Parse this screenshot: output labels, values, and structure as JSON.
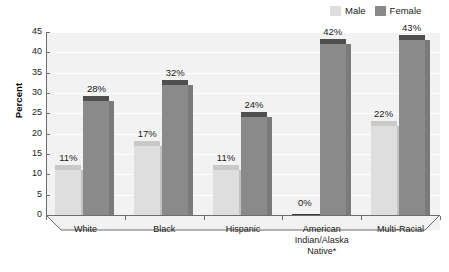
{
  "chart_data": {
    "type": "bar",
    "title": "",
    "xlabel": "",
    "ylabel": "Percent",
    "ylim": [
      0,
      45
    ],
    "ytick_step": 5,
    "yticks": [
      "45",
      "40",
      "35",
      "30",
      "25",
      "20",
      "15",
      "10",
      "5",
      "0"
    ],
    "grid": true,
    "legend_position": "top-right",
    "value_label_suffix": "%",
    "categories": [
      "White",
      "Black",
      "Hispanic",
      "American Indian/Alaska Native*",
      "Multi-Racial"
    ],
    "category_lines": [
      [
        "White"
      ],
      [
        "Black"
      ],
      [
        "Hispanic"
      ],
      [
        "American",
        "Indian/Alaska",
        "Native*"
      ],
      [
        "Multi-Racial"
      ]
    ],
    "series": [
      {
        "name": "Male",
        "color": "#dedede",
        "values": [
          11,
          17,
          11,
          0,
          22
        ],
        "labels": [
          "11%",
          "17%",
          "11%",
          "0%",
          "22%"
        ]
      },
      {
        "name": "Female",
        "color": "#8a8a8a",
        "values": [
          28,
          32,
          24,
          42,
          43
        ],
        "labels": [
          "28%",
          "32%",
          "24%",
          "42%",
          "43%"
        ]
      }
    ]
  },
  "legend": {
    "items": [
      {
        "label": "Male",
        "swatch": "male"
      },
      {
        "label": "Female",
        "swatch": "female"
      }
    ]
  },
  "colors": {
    "male": "#dedede",
    "female": "#8a8a8a",
    "plot_background": "#f2f2f2",
    "gridline": "#ffffff",
    "axis": "#6d6d6d",
    "text": "#1a1a1a"
  }
}
